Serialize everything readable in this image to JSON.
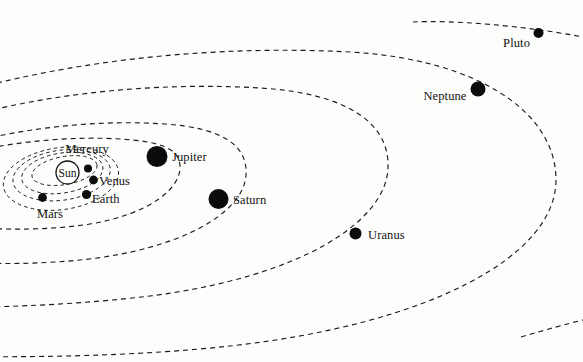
{
  "figure": {
    "kind": "solar-system-orbit-diagram",
    "background_color": "#fdfdfc",
    "line_color": "#1b1b1b",
    "body_color": "#0b0b0b"
  },
  "bodies": [
    {
      "id": "sun",
      "label": "Sun",
      "type": "star",
      "marker": "open-circle",
      "cx": 67.5,
      "cy": 172.5,
      "r": 11.5,
      "label_x": 67.5,
      "label_y": 176.5,
      "label_anchor": "middle"
    },
    {
      "id": "mercury",
      "label": "Mercury",
      "type": "planet",
      "marker": "filled-dot",
      "cx": 88.0,
      "cy": 168.5,
      "r": 4.0,
      "label_x": 87.0,
      "label_y": 153.0,
      "label_anchor": "middle"
    },
    {
      "id": "venus",
      "label": "Venus",
      "type": "planet",
      "marker": "filled-dot",
      "cx": 93.5,
      "cy": 180.0,
      "r": 4.4,
      "label_x": 99.0,
      "label_y": 184.5,
      "label_anchor": "start"
    },
    {
      "id": "earth",
      "label": "Earth",
      "type": "planet",
      "marker": "filled-dot",
      "cx": 86.5,
      "cy": 194.5,
      "r": 4.6,
      "label_x": 92.0,
      "label_y": 203.0,
      "label_anchor": "start"
    },
    {
      "id": "mars",
      "label": "Mars",
      "type": "planet",
      "marker": "filled-dot",
      "cx": 42.5,
      "cy": 197.5,
      "r": 4.4,
      "label_x": 50.0,
      "label_y": 217.5,
      "label_anchor": "middle"
    },
    {
      "id": "jupiter",
      "label": "Jupiter",
      "type": "planet",
      "marker": "filled-dot",
      "cx": 157.0,
      "cy": 156.5,
      "r": 10.5,
      "label_x": 172.0,
      "label_y": 161.0,
      "label_anchor": "start"
    },
    {
      "id": "saturn",
      "label": "Saturn",
      "type": "planet",
      "marker": "filled-dot",
      "cx": 218.5,
      "cy": 199.0,
      "r": 10.0,
      "label_x": 233.0,
      "label_y": 203.5,
      "label_anchor": "start"
    },
    {
      "id": "uranus",
      "label": "Uranus",
      "type": "planet",
      "marker": "filled-dot",
      "cx": 355.5,
      "cy": 233.5,
      "r": 6.0,
      "label_x": 368.0,
      "label_y": 238.5,
      "label_anchor": "start"
    },
    {
      "id": "neptune",
      "label": "Neptune",
      "type": "planet",
      "marker": "filled-dot",
      "cx": 478.0,
      "cy": 89.0,
      "r": 7.5,
      "label_x": 466.5,
      "label_y": 100.0,
      "label_anchor": "end"
    },
    {
      "id": "pluto",
      "label": "Pluto",
      "type": "planet",
      "marker": "filled-dot",
      "cx": 538.5,
      "cy": 33.0,
      "r": 5.0,
      "label_x": 530.0,
      "label_y": 47.0,
      "label_anchor": "end"
    }
  ],
  "orbits": [
    {
      "id": "orbit-mercury",
      "for": "mercury",
      "kind": "inner",
      "path": "M 97 165 A 33 14 -10 1 1 84.5 156.5 A 33 14 -10 0 1 97 165 Z"
    },
    {
      "id": "orbit-venus",
      "for": "venus",
      "kind": "inner",
      "path": "M 102 172.5 A 41 20 -9 1 1 82 153 A 41 20 -9 0 1 102 172.5 Z"
    },
    {
      "id": "orbit-earth",
      "for": "earth",
      "kind": "inner",
      "path": "M 108 178 A 49 25 -8 1 1 80 150 A 49 25 -8 0 1 108 178 Z"
    },
    {
      "id": "orbit-mars",
      "for": "mars",
      "kind": "inner",
      "path": "M 115 184 A 58 31 -8 1 1 76 147 A 58 31 -8 0 1 115 184 Z"
    },
    {
      "id": "orbit-jupiter",
      "for": "jupiter",
      "kind": "outer",
      "path": "M -140 205 C -90 152 40 134 120 139 C 160 141.5 178 148 180 165 C 182 188 150 214 90 224 C 20 235 -80 228 -140 205 Z"
    },
    {
      "id": "orbit-saturn",
      "for": "saturn",
      "kind": "outer",
      "path": "M -200 230 C -120 146 50 116 165 124 C 222 128 248 145 246 175 C 244 213 180 250 80 260 C -20 270 -140 258 -200 230 Z"
    },
    {
      "id": "orbit-uranus",
      "for": "uranus",
      "kind": "outer",
      "path": "M -300 286 C -200 128 60 76 260 88 C 345 93 390 122 388 168 C 386 222 300 277 150 296 C 10 313 -190 312 -300 286 Z"
    },
    {
      "id": "orbit-neptune",
      "for": "neptune",
      "kind": "outer",
      "path": "M -380 322 C -260 106 90 38 350 52 C 474 59 556 110 556 180 C 556 256 430 324 230 346 C 50 366 -250 358 -380 322 Z"
    },
    {
      "id": "orbit-pluto",
      "for": "pluto",
      "kind": "outer-open-top",
      "path": "M 413 22 C 450 20 520 25 583 37"
    },
    {
      "id": "orbit-pluto-tail",
      "for": "pluto",
      "kind": "outer-open-bottom",
      "path": "M 521 337 C 545 330 566 324 583 320"
    }
  ]
}
